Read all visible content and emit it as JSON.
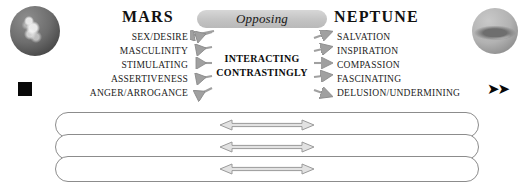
{
  "left_planet": {
    "name": "mars-planet-image",
    "title": "MARS",
    "glyph_name": "mars-symbol-glyph",
    "glyph": "",
    "keywords": [
      "SEX/DESIRE",
      "MASCULINITY",
      "STIMULATING",
      "ASSERTIVENESS",
      "ANGER/ARROGANCE"
    ]
  },
  "right_planet": {
    "name": "neptune-planet-image",
    "title": "NEPTUNE",
    "glyph_name": "neptune-symbol-glyph",
    "glyph": "➤➤",
    "keywords": [
      "SALVATION",
      "INSPIRATION",
      "COMPASSION",
      "FASCINATING",
      "DELUSION/UNDERMINING"
    ]
  },
  "center": {
    "pill_label": "Opposing",
    "interaction_line1": "INTERACTING",
    "interaction_line2": "CONTRASTINGLY"
  },
  "bars": {
    "count": 3,
    "arrow_name": "double-headed-arrow",
    "arrow_direction": "bidirectional"
  },
  "colors": {
    "pill_fill": "#c3c3c3",
    "arrow_gray": "#9a9a9a",
    "bar_outline": "#8c8c8c",
    "text": "#1b1b1b",
    "background": "#ffffff"
  }
}
